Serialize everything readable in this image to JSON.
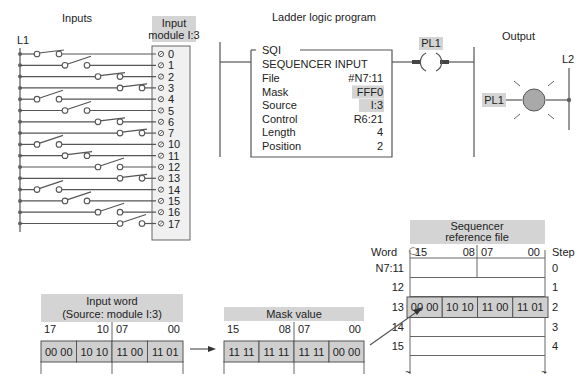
{
  "inputs_section": {
    "title": "Inputs",
    "rail_label": "L1",
    "module_label_line1": "Input",
    "module_label_line2": "module I:3",
    "terminals": [
      "0",
      "1",
      "2",
      "3",
      "4",
      "5",
      "6",
      "7",
      "10",
      "11",
      "12",
      "13",
      "14",
      "15",
      "16",
      "17"
    ],
    "switch_states": [
      "closed",
      "open",
      "closed",
      "closed",
      "open",
      "open",
      "closed",
      "closed",
      "open",
      "closed",
      "open",
      "closed",
      "open",
      "open",
      "open",
      "open"
    ],
    "switch_positions": [
      3,
      2,
      1,
      0,
      3,
      2,
      1,
      0,
      3,
      2,
      1,
      0,
      3,
      2,
      1,
      0
    ]
  },
  "ladder": {
    "title": "Ladder logic program",
    "instruction": {
      "mnemonic": "SQI",
      "name": "SEQUENCER INPUT",
      "rows": [
        {
          "label": "File",
          "value": "#N7:11",
          "highlight": false
        },
        {
          "label": "Mask",
          "value": "FFF0",
          "highlight": true
        },
        {
          "label": "Source",
          "value": "I:3",
          "highlight": true
        },
        {
          "label": "Control",
          "value": "R6:21",
          "highlight": false
        },
        {
          "label": "Length",
          "value": "4",
          "highlight": false
        },
        {
          "label": "Position",
          "value": "2",
          "highlight": false
        }
      ]
    },
    "coil_label": "PL1"
  },
  "output_section": {
    "title": "Output",
    "rail_label": "L2",
    "lamp_label": "PL1",
    "lamp_color": "#a9a9a9"
  },
  "input_word": {
    "title_line1": "Input word",
    "title_line2": "(Source: module I:3)",
    "bit_labels": {
      "high_left": "17",
      "high_right": "10",
      "low_left": "07",
      "low_right": "00"
    },
    "nibbles": [
      "00 00",
      "10 10",
      "11 00",
      "11 01"
    ]
  },
  "mask_value": {
    "title": "Mask value",
    "bit_labels": {
      "high_left": "15",
      "high_right": "08",
      "low_left": "07",
      "low_right": "00"
    },
    "nibbles": [
      "11 11",
      "11 11",
      "11 11",
      "00 00"
    ]
  },
  "sequencer_file": {
    "title_line1": "Sequencer",
    "title_line2": "reference file",
    "word_header": "Word",
    "step_header": "Step",
    "bit_labels": {
      "high_left": "15",
      "high_right": "08",
      "low_left": "07",
      "low_right": "00"
    },
    "words": [
      "N7:11",
      "12",
      "13",
      "14",
      "15"
    ],
    "steps": [
      "0",
      "1",
      "2",
      "3",
      "4"
    ],
    "active_row_index": 2,
    "active_row_nibbles": [
      "00 00",
      "10 10",
      "11 00",
      "11 01"
    ]
  },
  "colors": {
    "label_bg": "#d4d4d4",
    "cell_bg": "#cfcfcf",
    "line": "#555555"
  }
}
